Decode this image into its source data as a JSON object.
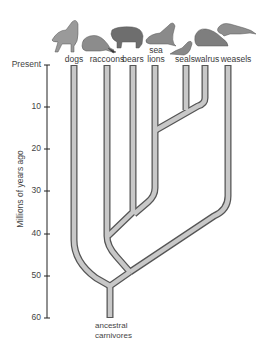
{
  "figure": {
    "type": "phylogenetic-tree",
    "y_axis": {
      "label": "Millions of years ago",
      "ticks": [
        {
          "value": 0,
          "label": "Present"
        },
        {
          "value": 10,
          "label": "10"
        },
        {
          "value": 20,
          "label": "20"
        },
        {
          "value": 30,
          "label": "30"
        },
        {
          "value": 40,
          "label": "40"
        },
        {
          "value": 50,
          "label": "50"
        },
        {
          "value": 60,
          "label": "60"
        }
      ]
    },
    "taxa": [
      {
        "id": "dogs",
        "label": "dogs"
      },
      {
        "id": "raccoons",
        "label": "raccoons"
      },
      {
        "id": "bears",
        "label": "bears"
      },
      {
        "id": "sea_lions",
        "label_line1": "sea",
        "label_line2": "lions"
      },
      {
        "id": "seals",
        "label": "seals"
      },
      {
        "id": "walrus",
        "label": "walrus"
      },
      {
        "id": "weasels",
        "label": "weasels"
      }
    ],
    "root": {
      "line1": "ancestral",
      "line2": "carnivores"
    },
    "branch_points_mya": {
      "root": 57,
      "dogs_vs_rest": 53,
      "weasels_split": 50,
      "raccoons_split": 41,
      "bears_split": 35,
      "sea_lions_split": 16,
      "seals_walrus_split": 10
    },
    "colors": {
      "branch_fill": "#c8c8c8",
      "branch_stroke": "#555555",
      "axis": "#222222"
    }
  }
}
